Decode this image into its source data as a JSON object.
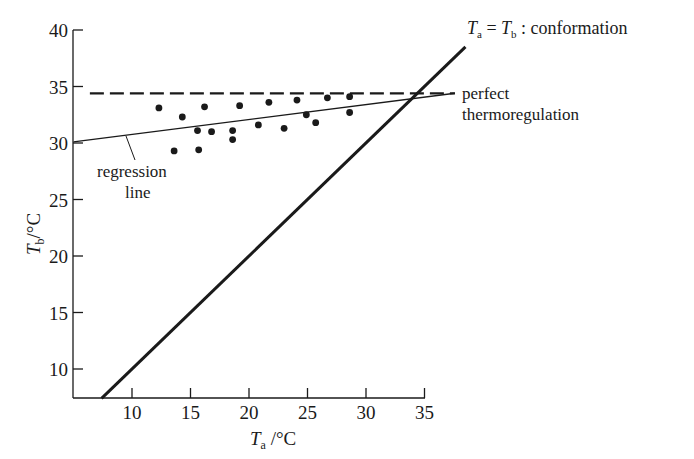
{
  "chart_data": {
    "type": "scatter",
    "title": "",
    "xlabel": "T_a /°C",
    "ylabel": "T_b /°C",
    "xlabel_parts": {
      "symbol": "T",
      "subscript": "a",
      "unit": "/°C"
    },
    "ylabel_parts": {
      "symbol": "T",
      "subscript": "b",
      "unit": "/°C"
    },
    "xlim": [
      5,
      35
    ],
    "ylim": [
      7.4,
      40
    ],
    "x_ticks": [
      10,
      15,
      20,
      25,
      30,
      35
    ],
    "y_ticks": [
      10,
      15,
      20,
      25,
      30,
      35,
      40
    ],
    "grid": false,
    "series": [
      {
        "name": "observations",
        "type": "scatter",
        "points": [
          [
            12.3,
            33.1
          ],
          [
            14.3,
            32.3
          ],
          [
            13.6,
            29.3
          ],
          [
            16.2,
            33.2
          ],
          [
            15.6,
            31.1
          ],
          [
            16.8,
            31.0
          ],
          [
            15.7,
            29.4
          ],
          [
            19.2,
            33.3
          ],
          [
            18.6,
            31.1
          ],
          [
            18.6,
            30.3
          ],
          [
            21.7,
            33.6
          ],
          [
            20.8,
            31.6
          ],
          [
            23.0,
            31.3
          ],
          [
            24.1,
            33.8
          ],
          [
            24.9,
            32.5
          ],
          [
            25.7,
            31.8
          ],
          [
            26.7,
            34.0
          ],
          [
            28.6,
            34.1
          ],
          [
            28.6,
            32.7
          ]
        ]
      },
      {
        "name": "regression line",
        "type": "line",
        "style": "thin solid",
        "x": [
          5.0,
          37.6
        ],
        "y": [
          30.1,
          34.4
        ]
      },
      {
        "name": "perfect thermoregulation",
        "type": "line",
        "style": "dashed",
        "x": [
          6.4,
          37.6
        ],
        "y": [
          34.4,
          34.4
        ]
      },
      {
        "name": "T_a = T_b : conformation",
        "type": "line",
        "style": "thick solid",
        "x": [
          7.4,
          38.5
        ],
        "y": [
          7.4,
          38.5
        ]
      }
    ],
    "annotations": [
      {
        "text": "regression line",
        "lines": [
          "regression",
          "line"
        ],
        "points_to": "regression line"
      },
      {
        "text": "perfect thermoregulation",
        "lines": [
          "perfect",
          "thermoregulation"
        ],
        "points_to": "dashed line"
      },
      {
        "text": "T_a = T_b : conformation",
        "points_to": "diagonal line"
      }
    ],
    "legend": "none (inline annotations)"
  },
  "labels": {
    "y_tick_labels": [
      "40",
      "35",
      "30",
      "25",
      "20",
      "15",
      "10"
    ],
    "x_tick_labels": [
      "10",
      "15",
      "20",
      "25",
      "30",
      "35"
    ],
    "regression_line1": "regression",
    "regression_line2": "line",
    "perfect_line1": "perfect",
    "perfect_line2": "thermoregulation",
    "conform_T1": "T",
    "conform_sub1": "a",
    "conform_eq": " = ",
    "conform_T2": "T",
    "conform_sub2": "b",
    "conform_rest": " : conformation",
    "x_title_T": "T",
    "x_title_sub": "a",
    "x_title_unit": " /°C",
    "y_title_T": "T",
    "y_title_sub": "b",
    "y_title_unit": "/°C"
  },
  "colors": {
    "ink": "#1a1a1a",
    "background": "#ffffff"
  }
}
